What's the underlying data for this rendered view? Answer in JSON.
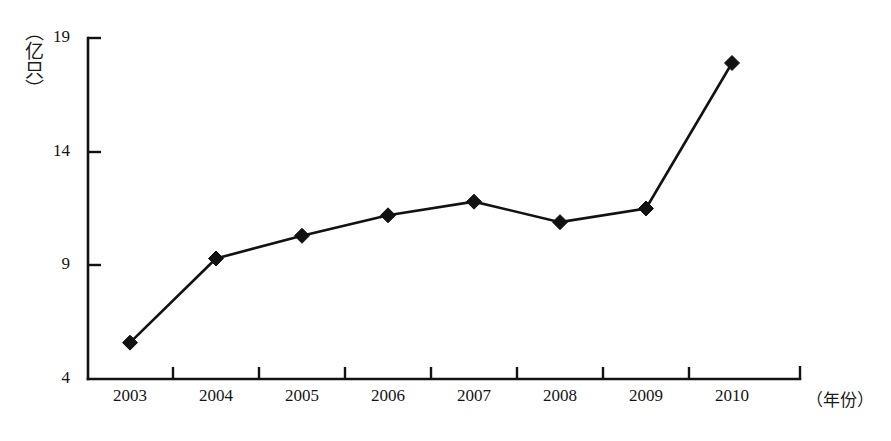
{
  "chart_data": {
    "type": "line",
    "title": "",
    "subtitle": "",
    "xlabel": "（年份）",
    "ylabel": "（亿只）",
    "categories": [
      "2003",
      "2004",
      "2005",
      "2006",
      "2007",
      "2008",
      "2009",
      "2010"
    ],
    "values": [
      5.6,
      9.3,
      10.3,
      11.2,
      11.8,
      10.9,
      11.5,
      17.9
    ],
    "series": [
      {
        "name": "",
        "values": [
          5.6,
          9.3,
          10.3,
          11.2,
          11.8,
          10.9,
          11.5,
          17.9
        ]
      }
    ],
    "ylim": [
      4,
      19
    ],
    "y_ticks": [
      "4",
      "9",
      "14",
      "19"
    ],
    "y_tick_values": [
      4,
      9,
      14,
      19
    ],
    "x_ticks": [
      "2003",
      "2004",
      "2005",
      "2006",
      "2007",
      "2008",
      "2009",
      "2010"
    ],
    "grid": false,
    "legend": null,
    "legend_position": "none",
    "marker": "diamond",
    "line_color": "#121212",
    "marker_color": "#121212",
    "background_color": "#ffffff",
    "annotations": []
  },
  "axes": {
    "y_unit_label": "（亿只）",
    "x_unit_label": "（年份）",
    "y_tick_labels": {
      "t19": "19",
      "t14": "14",
      "t9": "9",
      "t4": "4"
    }
  }
}
